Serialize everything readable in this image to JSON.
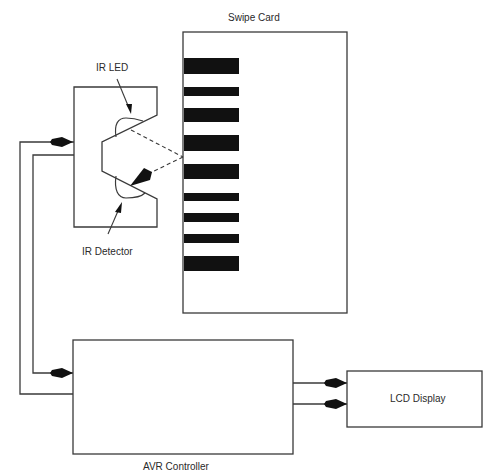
{
  "diagram": {
    "type": "block-diagram",
    "components": {
      "swipe_card": {
        "label": "Swipe Card",
        "barcode_bars": 9
      },
      "ir_led": {
        "label": "IR LED"
      },
      "ir_detector": {
        "label": "IR Detector"
      },
      "avr_controller": {
        "label": "AVR Controller"
      },
      "lcd_display": {
        "label": "LCD Display"
      }
    },
    "connections": [
      {
        "from": "avr_controller",
        "to": "ir_sensor",
        "type": "arrow"
      },
      {
        "from": "ir_sensor",
        "to": "avr_controller",
        "type": "arrow"
      },
      {
        "from": "avr_controller",
        "to": "lcd_display",
        "type": "arrow",
        "count": 2
      },
      {
        "from": "ir_led",
        "to": "swipe_card",
        "type": "dashed-light-path"
      },
      {
        "from": "swipe_card",
        "to": "ir_detector",
        "type": "dashed-light-path"
      }
    ],
    "colors": {
      "line": "#3a3a3a",
      "bar": "#111111",
      "background": "#ffffff"
    }
  }
}
